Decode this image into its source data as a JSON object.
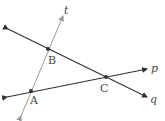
{
  "diagram": {
    "lines": [
      {
        "name": "t",
        "label": "t",
        "x1": 21,
        "y1": 116,
        "x2": 63,
        "y2": 16,
        "color": "#9a9a9a"
      },
      {
        "name": "q",
        "label": "q",
        "x1": 8,
        "y1": 29,
        "x2": 147,
        "y2": 97,
        "color": "#333333"
      },
      {
        "name": "p",
        "label": "p",
        "x1": 7,
        "y1": 97,
        "x2": 147,
        "y2": 69,
        "color": "#333333"
      }
    ],
    "points": [
      {
        "name": "A",
        "label": "A",
        "x": 31,
        "y": 91
      },
      {
        "name": "B",
        "label": "B",
        "x": 48,
        "y": 49
      },
      {
        "name": "C",
        "label": "C",
        "x": 106,
        "y": 77
      }
    ]
  }
}
